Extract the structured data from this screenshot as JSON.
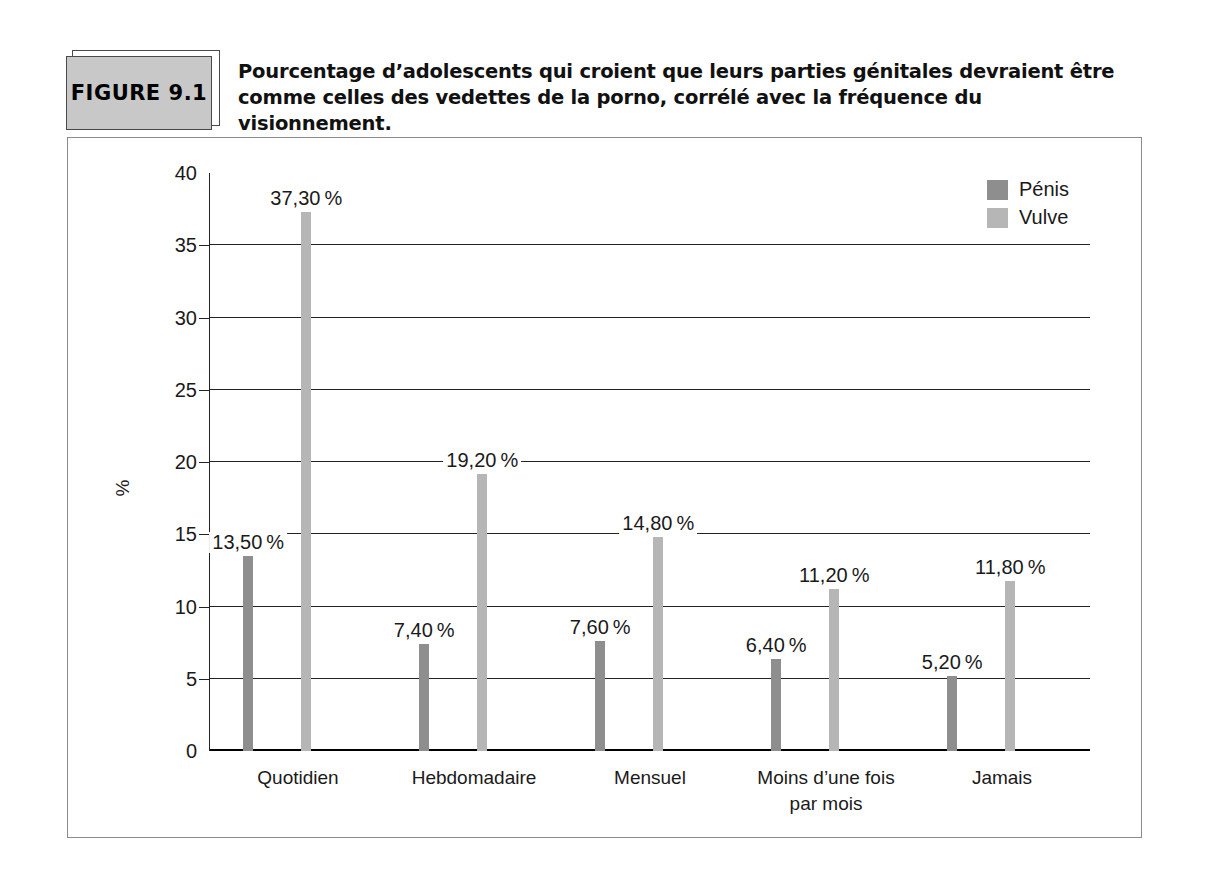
{
  "figure": {
    "badge_label": "FIGURE  9.1",
    "caption_line1": "Pourcentage d’adolescents qui croient que leurs parties génitales devraient être",
    "caption_line2": "comme celles des vedettes de la porno, corrélé avec la fréquence du visionnement."
  },
  "legend": {
    "items": [
      {
        "label": "Pénis",
        "color": "#8e8e8e",
        "key": "penis"
      },
      {
        "label": "Vulve",
        "color": "#b6b6b6",
        "key": "vulve"
      }
    ]
  },
  "chart_data": {
    "type": "bar",
    "title": "Pourcentage d’adolescents qui croient que leurs parties génitales devraient être comme celles des vedettes de la porno, corrélé avec la fréquence du visionnement.",
    "xlabel": "",
    "ylabel": "%",
    "ylim": [
      0,
      40
    ],
    "yticks": [
      0,
      5,
      10,
      15,
      20,
      25,
      30,
      35,
      40
    ],
    "ytick_labels": [
      "0",
      "5",
      "10",
      "15",
      "20",
      "25",
      "30",
      "35",
      "40"
    ],
    "grid": true,
    "legend_position": "top-right",
    "categories": [
      "Quotidien",
      "Hebdomadaire",
      "Mensuel",
      "Moins d’une fois par mois",
      "Jamais"
    ],
    "category_labels": [
      {
        "line1": "Quotidien",
        "line2": ""
      },
      {
        "line1": "Hebdomadaire",
        "line2": ""
      },
      {
        "line1": "Mensuel",
        "line2": ""
      },
      {
        "line1": "Moins d’une fois",
        "line2": "par mois"
      },
      {
        "line1": "Jamais",
        "line2": ""
      }
    ],
    "series": [
      {
        "name": "Pénis",
        "color": "#8e8e8e",
        "values": [
          13.5,
          7.4,
          7.6,
          6.4,
          5.2
        ],
        "value_labels": [
          "13,50 %",
          "7,40 %",
          "7,60 %",
          "6,40 %",
          "5,20 %"
        ]
      },
      {
        "name": "Vulve",
        "color": "#b6b6b6",
        "values": [
          37.3,
          19.2,
          14.8,
          11.2,
          11.8
        ],
        "value_labels": [
          "37,30 %",
          "19,20 %",
          "14,80 %",
          "11,20 %",
          "11,80 %"
        ]
      }
    ]
  }
}
